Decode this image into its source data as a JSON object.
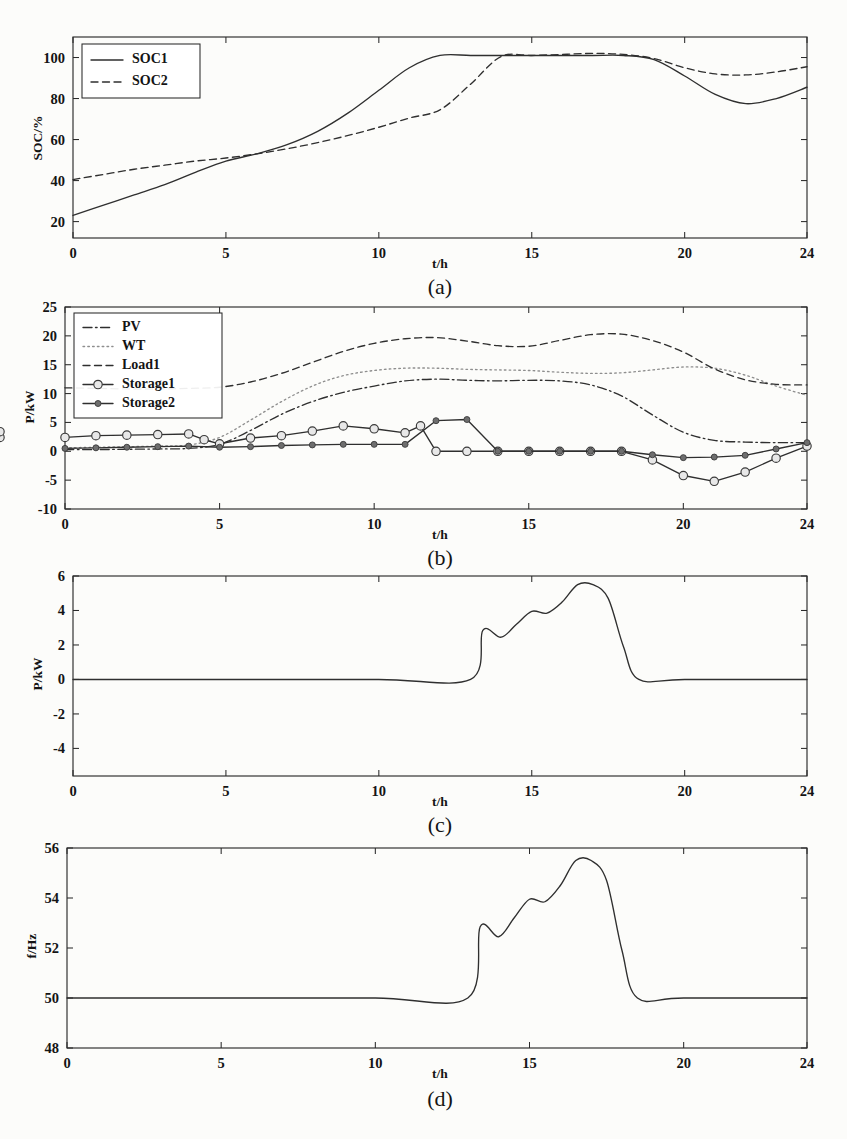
{
  "figure": {
    "xlabel": "t/h",
    "panels": [
      "(a)",
      "(b)",
      "(c)",
      "(d)"
    ]
  },
  "chart_data": [
    {
      "id": "a",
      "type": "line",
      "caption": "(a)",
      "title": "",
      "xlabel": "t/h",
      "ylabel": "SOC/%",
      "xlim": [
        0,
        24
      ],
      "ylim": [
        12,
        110
      ],
      "xticks": [
        0,
        5,
        10,
        15,
        20,
        24
      ],
      "yticks": [
        20,
        40,
        60,
        80,
        100
      ],
      "grid": false,
      "legend_position": "top-left",
      "x": [
        0,
        1,
        2,
        3,
        4,
        5,
        6,
        7,
        8,
        9,
        10,
        11,
        12,
        13,
        14,
        15,
        16,
        17,
        18,
        19,
        20,
        21,
        22,
        23,
        24
      ],
      "series": [
        {
          "name": "SOC1",
          "style": "solid",
          "marker": "none",
          "values": [
            23,
            28,
            33,
            38,
            44,
            49.5,
            53,
            57.5,
            64,
            73,
            84,
            95,
            101,
            101,
            101,
            101,
            101,
            101,
            101,
            99,
            91,
            82,
            77.5,
            80,
            85.5
          ]
        },
        {
          "name": "SOC2",
          "style": "dashed",
          "marker": "none",
          "values": [
            40.5,
            43,
            45.5,
            47.5,
            49.5,
            51,
            53,
            55.5,
            58.5,
            62,
            66,
            70.5,
            74.5,
            87,
            100.5,
            101,
            101.5,
            102,
            101.5,
            99.5,
            95,
            92,
            91.5,
            93,
            95.5
          ]
        }
      ]
    },
    {
      "id": "b",
      "type": "line",
      "caption": "(b)",
      "title": "",
      "xlabel": "t/h",
      "ylabel": "P/kW",
      "xlim": [
        0,
        24
      ],
      "ylim": [
        -10,
        25
      ],
      "xticks": [
        0,
        5,
        10,
        15,
        20,
        24
      ],
      "yticks": [
        -10,
        -5,
        0,
        5,
        10,
        15,
        20,
        25
      ],
      "grid": false,
      "legend_position": "top-left",
      "x": [
        0,
        1,
        2,
        3,
        4,
        5,
        6,
        7,
        8,
        9,
        10,
        11,
        12,
        13,
        14,
        15,
        16,
        17,
        18,
        19,
        20,
        21,
        22,
        23,
        24
      ],
      "series": [
        {
          "name": "PV",
          "style": "dashdot",
          "marker": "none",
          "values": [
            0.3,
            0.3,
            0.35,
            0.4,
            0.5,
            1.2,
            3.6,
            6.4,
            8.6,
            10.2,
            11.3,
            12.2,
            12.5,
            12.3,
            12.2,
            12.3,
            12.2,
            11.5,
            9.6,
            6.3,
            3.3,
            1.9,
            1.6,
            1.5,
            1.5
          ]
        },
        {
          "name": "WT",
          "style": "dotted",
          "marker": "none",
          "values": [
            0.6,
            0.7,
            0.8,
            0.9,
            1.1,
            2.4,
            5.4,
            8.6,
            11.3,
            13.1,
            14.0,
            14.4,
            14.4,
            14.2,
            14.1,
            14.0,
            13.7,
            13.5,
            13.6,
            14.1,
            14.6,
            14.4,
            13.2,
            11.3,
            9.7
          ]
        },
        {
          "name": "Load1",
          "style": "dashed",
          "marker": "none",
          "values": [
            11.0,
            10.9,
            10.8,
            10.8,
            10.9,
            11.1,
            12.0,
            13.5,
            15.4,
            17.3,
            18.7,
            19.5,
            19.7,
            19.1,
            18.3,
            18.2,
            19.2,
            20.2,
            20.3,
            19.2,
            17.2,
            14.3,
            12.4,
            11.6,
            11.5
          ]
        },
        {
          "name": "Storage1",
          "style": "solid-marker",
          "marker": "open-circle",
          "values": [
            2.4,
            2.7,
            2.8,
            2.9,
            3.0,
            3.0,
            3.0,
            2.9,
            3.0,
            1.8,
            1.3,
            1.7,
            2.3,
            2.6,
            2.4,
            3.2,
            4.1,
            4.7,
            5.1,
            5.6,
            6.2,
            5.7,
            5.2,
            4.6,
            4.3
          ]
        },
        {
          "name": "Storage2",
          "style": "solid-marker",
          "marker": "filled-dot",
          "values": [
            0.4,
            0.5,
            0.6,
            0.7,
            0.8,
            0.9,
            1.0,
            1.05,
            1.1,
            1.1,
            1.1,
            1.15,
            1.2,
            1.2,
            1.25,
            1.3,
            1.35,
            1.35,
            1.3,
            1.2,
            1.1,
            1.05,
            1.0,
            1.0,
            1.0
          ]
        }
      ],
      "note_series": [
        {
          "name": "Storage1-dispatch",
          "style": "solid-marker",
          "marker": "open-circle",
          "x": [
            0,
            1,
            2,
            3,
            4,
            4.5,
            5,
            6,
            7,
            8,
            9,
            10,
            11,
            11.5,
            12,
            13,
            14,
            15,
            16,
            17,
            18,
            19,
            20,
            21,
            22,
            23,
            24
          ],
          "values": [
            2.4,
            2.7,
            2.8,
            2.9,
            3.0,
            2.0,
            1.3,
            2.3,
            2.7,
            3.5,
            4.4,
            3.9,
            3.2,
            4.4,
            0.0,
            0.0,
            0.0,
            0.0,
            0.0,
            0.0,
            0.0,
            -1.5,
            -4.2,
            -5.2,
            -3.6,
            -1.2,
            0.9,
            2.4,
            3.4
          ]
        },
        {
          "name": "Storage2-dispatch",
          "style": "solid-marker",
          "marker": "filled-dot",
          "x": [
            0,
            1,
            2,
            3,
            4,
            5,
            6,
            7,
            8,
            9,
            10,
            11,
            12,
            13,
            14,
            15,
            16,
            17,
            18,
            19,
            20,
            21,
            22,
            23,
            24
          ],
          "values": [
            0.5,
            0.6,
            0.7,
            0.8,
            0.9,
            0.7,
            0.8,
            1.0,
            1.1,
            1.2,
            1.2,
            1.2,
            5.3,
            5.5,
            0.0,
            0.0,
            0.0,
            0.0,
            0.0,
            -0.6,
            -1.1,
            -1.0,
            -0.7,
            0.4,
            1.5
          ]
        }
      ]
    },
    {
      "id": "c",
      "type": "line",
      "caption": "(c)",
      "title": "",
      "xlabel": "t/h",
      "ylabel": "P/kW",
      "xlim": [
        0,
        24
      ],
      "ylim": [
        -5.6,
        6
      ],
      "xticks": [
        0,
        5,
        10,
        15,
        20,
        24
      ],
      "yticks": [
        -4,
        -2,
        0,
        2,
        4,
        6
      ],
      "grid": false,
      "legend_position": "none",
      "x": [
        0,
        5,
        10,
        13,
        13.4,
        14,
        14.5,
        15,
        15.5,
        16,
        16.5,
        17,
        17.5,
        18,
        18.5,
        20,
        24
      ],
      "series": [
        {
          "name": "Power",
          "style": "solid",
          "marker": "none",
          "values": [
            0,
            0,
            0,
            0,
            2.85,
            2.45,
            3.2,
            3.95,
            3.85,
            4.5,
            5.5,
            5.5,
            4.7,
            1.9,
            0,
            0,
            0
          ]
        }
      ]
    },
    {
      "id": "d",
      "type": "line",
      "caption": "(d)",
      "title": "",
      "xlabel": "t/h",
      "ylabel": "f/Hz",
      "xlim": [
        0,
        24
      ],
      "ylim": [
        48,
        56
      ],
      "xticks": [
        0,
        5,
        10,
        15,
        20,
        24
      ],
      "yticks": [
        48,
        50,
        52,
        54,
        56
      ],
      "grid": false,
      "legend_position": "none",
      "x": [
        0,
        5,
        10,
        13,
        13.4,
        14,
        14.5,
        15,
        15.5,
        16,
        16.5,
        17,
        17.5,
        18,
        18.5,
        20,
        24
      ],
      "series": [
        {
          "name": "Frequency",
          "style": "solid",
          "marker": "none",
          "values": [
            50,
            50,
            50,
            50,
            52.85,
            52.45,
            53.2,
            53.95,
            53.85,
            54.5,
            55.5,
            55.5,
            54.7,
            51.9,
            50,
            50,
            50
          ]
        }
      ]
    }
  ],
  "legends": {
    "a": [
      {
        "label": "SOC1",
        "style": "solid"
      },
      {
        "label": "SOC2",
        "style": "dashed"
      }
    ],
    "b": [
      {
        "label": "PV",
        "style": "dashdot"
      },
      {
        "label": "WT",
        "style": "dotted"
      },
      {
        "label": "Load1",
        "style": "dashed"
      },
      {
        "label": "Storage1",
        "style": "solid-marker",
        "marker": "open-circle"
      },
      {
        "label": "Storage2",
        "style": "solid-marker",
        "marker": "filled-dot"
      }
    ]
  },
  "colors": {
    "ink": "#2b2b2b",
    "grey": "#8e8e8e",
    "marker_open_fill": "#e8e8e8",
    "marker_filled": "#6e6e6e",
    "background": "#fcfcfa"
  }
}
